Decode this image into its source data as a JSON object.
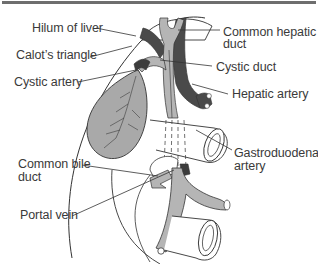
{
  "diagram": {
    "title": "",
    "colors": {
      "outline": "#333333",
      "bile_duct": "#b5b5b5",
      "artery": "#4a4a4a",
      "gallbladder": "#a9a9a9",
      "background": "#ffffff",
      "label_text": "#3a3a3a",
      "top_rule": "#6e6e6e"
    },
    "labels": {
      "hilum": "Hilum of liver",
      "calot": "Calot’s triangle",
      "cystic_artery": "Cystic artery",
      "common_hepatic_1": "Common hepatic",
      "common_hepatic_2": "duct",
      "cystic_duct": "Cystic duct",
      "hepatic_artery": "Hepatic artery",
      "common_bile_1": "Common bile",
      "common_bile_2": "duct",
      "gastroduodenal_1": "Gastroduodenal",
      "gastroduodenal_2": "artery",
      "portal_vein": "Portal vein"
    }
  }
}
